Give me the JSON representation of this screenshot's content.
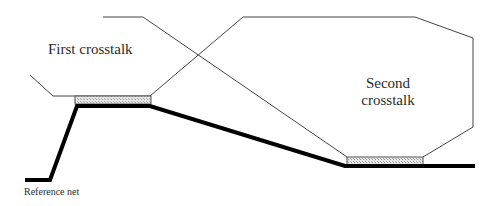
{
  "labels": {
    "first_crosstalk": "First crosstalk",
    "second_crosstalk_line1": "Second",
    "second_crosstalk_line2": "crosstalk",
    "reference_net": "Reference net"
  },
  "colors": {
    "thin_line": "#444444",
    "thick_line": "#000000",
    "hatch_fill": "#d8d8d8",
    "hatch_border": "#555555",
    "background": "#ffffff"
  },
  "geometry": {
    "first_aggressor_net": "30,75 53,96 75,96 150,96 243,17 415,17 473,38 473,127 423,157",
    "second_aggressor_net": "103,17 143,17 347,157",
    "reference_net": "25,180 50,180 77,106 150,106 345,166 475,166",
    "coupling_region_1": {
      "x": 75,
      "y": 96,
      "w": 76,
      "h": 8
    },
    "coupling_region_2": {
      "x": 347,
      "y": 157,
      "w": 76,
      "h": 9
    }
  }
}
